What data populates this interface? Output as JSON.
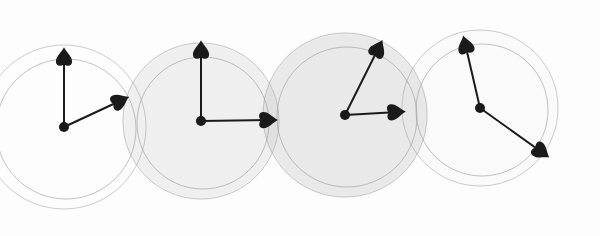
{
  "illustration": {
    "description": "Four overlapping watercolor clock faces with spade-tipped hands",
    "colors": {
      "background": "#fdfdfd",
      "wash": "#c8c8c8",
      "outline": "#9a9a9a",
      "hands": "#1a1a1a"
    },
    "clocks": [
      {
        "cx": 64,
        "cy": 127,
        "r": 82,
        "shade": 0.0,
        "hands": [
          [
            64,
            55
          ],
          [
            122,
            100
          ]
        ]
      },
      {
        "cx": 201,
        "cy": 121,
        "r": 78,
        "shade": 0.28,
        "hands": [
          [
            201,
            48
          ],
          [
            270,
            120
          ]
        ]
      },
      {
        "cx": 345,
        "cy": 115,
        "r": 82,
        "shade": 0.38,
        "hands": [
          [
            379,
            47
          ],
          [
            398,
            112
          ]
        ]
      },
      {
        "cx": 480,
        "cy": 108,
        "r": 78,
        "shade": 0.05,
        "hands": [
          [
            465,
            43
          ],
          [
            543,
            153
          ]
        ]
      }
    ]
  }
}
